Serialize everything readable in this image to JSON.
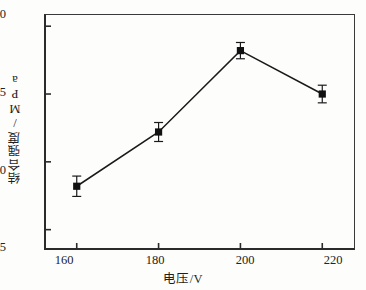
{
  "chart_data": {
    "type": "line",
    "title": "",
    "subtitle": "",
    "xlabel": "电压/V",
    "ylabel": "结合强度/MPa",
    "x": [
      160,
      180,
      200,
      220
    ],
    "values": [
      8.2,
      12.2,
      18.2,
      15.0
    ],
    "errors": [
      0.75,
      0.7,
      0.6,
      0.65
    ],
    "series": [
      {
        "name": "结合强度",
        "values": [
          8.2,
          12.2,
          18.2,
          15.0
        ],
        "errors": [
          0.75,
          0.7,
          0.6,
          0.65
        ]
      }
    ],
    "xlim": [
      152,
      228
    ],
    "ylim": [
      3.5,
      20.9
    ],
    "xticks": [
      160,
      180,
      200,
      220
    ],
    "yticks": [
      5,
      10,
      15,
      20
    ],
    "xtick_labels": [
      "160",
      "180",
      "200",
      "220"
    ],
    "ytick_labels": [
      "5",
      "10",
      "15",
      "20"
    ],
    "grid": false,
    "legend": false,
    "legend_position": "none",
    "marker": "filled-square",
    "line_color": "#1a1a1a",
    "marker_color": "#111111",
    "errorbar_color": "#1a1a1a",
    "axis_color": "#2b2b2b",
    "background_color": "#fdfdfc",
    "annotations": []
  }
}
